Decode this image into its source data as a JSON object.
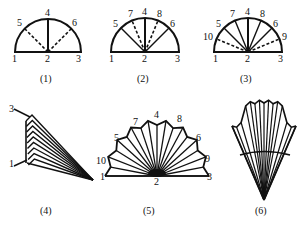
{
  "figures": [
    {
      "id": 1,
      "caption": "(1)",
      "labels": [
        "1",
        "2",
        "3",
        "4",
        "5",
        "6"
      ]
    },
    {
      "id": 2,
      "caption": "(2)",
      "labels": [
        "1",
        "2",
        "3",
        "4",
        "5",
        "6",
        "7",
        "8"
      ]
    },
    {
      "id": 3,
      "caption": "(3)",
      "labels": [
        "1",
        "2",
        "3",
        "4",
        "5",
        "6",
        "7",
        "8",
        "9",
        "10"
      ]
    },
    {
      "id": 4,
      "caption": "(4)",
      "labels": [
        "3",
        "1"
      ]
    },
    {
      "id": 5,
      "caption": "(5)",
      "labels": [
        "1",
        "2",
        "3",
        "4",
        "5",
        "6",
        "7",
        "8",
        "9",
        "10"
      ]
    },
    {
      "id": 6,
      "caption": "(6)",
      "labels": []
    }
  ],
  "colors": {
    "ink": "#111111",
    "background": "#ffffff"
  }
}
